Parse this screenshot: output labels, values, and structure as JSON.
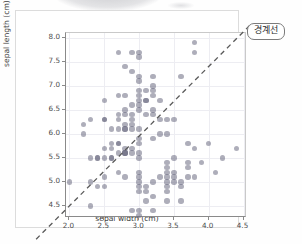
{
  "figure": {
    "annotation": {
      "label": "경계선",
      "name": "boundary-line-callout"
    },
    "watermark": {
      "visible": true
    }
  },
  "chart_data": {
    "type": "scatter",
    "title": "",
    "xlabel": "sepal width (cm)",
    "ylabel": "sepal length (cm)",
    "xlim": [
      1.95,
      4.55
    ],
    "ylim": [
      4.25,
      8.1
    ],
    "xticks": [
      "2.0",
      "2.5",
      "3.0",
      "3.5",
      "4.0",
      "4.5"
    ],
    "xtick_values": [
      2.0,
      2.5,
      3.0,
      3.5,
      4.0,
      4.5
    ],
    "yticks": [
      "4.5",
      "5.0",
      "5.5",
      "6.0",
      "6.5",
      "7.0",
      "7.5",
      "8.0"
    ],
    "ytick_values": [
      4.5,
      5.0,
      5.5,
      6.0,
      6.5,
      7.0,
      7.5,
      8.0
    ],
    "grid": true,
    "legend": "none",
    "marker": {
      "color": "#6b6b82",
      "alpha": 0.55,
      "size": 5.4,
      "shape": "circle"
    },
    "annotation_line": {
      "label": "경계선",
      "style": "dashed",
      "color": "#5a5a5a",
      "slope": 1.45,
      "intercept": 1.52,
      "x_from": 1.55,
      "x_to": 4.62
    },
    "points": [
      [
        2.0,
        5.0
      ],
      [
        2.2,
        6.2
      ],
      [
        2.2,
        6.0
      ],
      [
        2.3,
        6.3
      ],
      [
        2.3,
        5.5
      ],
      [
        2.3,
        5.0
      ],
      [
        2.3,
        4.5
      ],
      [
        2.4,
        5.5
      ],
      [
        2.4,
        5.5
      ],
      [
        2.4,
        4.9
      ],
      [
        2.5,
        6.3
      ],
      [
        2.5,
        6.7
      ],
      [
        2.5,
        6.3
      ],
      [
        2.5,
        5.7
      ],
      [
        2.5,
        5.5
      ],
      [
        2.5,
        5.1
      ],
      [
        2.5,
        4.9
      ],
      [
        2.6,
        6.1
      ],
      [
        2.6,
        5.8
      ],
      [
        2.6,
        5.7
      ],
      [
        2.6,
        5.5
      ],
      [
        2.6,
        5.5
      ],
      [
        2.7,
        7.7
      ],
      [
        2.7,
        6.8
      ],
      [
        2.7,
        6.4
      ],
      [
        2.7,
        6.3
      ],
      [
        2.7,
        6.1
      ],
      [
        2.7,
        5.8
      ],
      [
        2.7,
        5.8
      ],
      [
        2.7,
        5.6
      ],
      [
        2.7,
        5.2
      ],
      [
        2.8,
        7.4
      ],
      [
        2.8,
        6.8
      ],
      [
        2.8,
        6.5
      ],
      [
        2.8,
        6.4
      ],
      [
        2.8,
        6.2
      ],
      [
        2.8,
        6.1
      ],
      [
        2.8,
        6.1
      ],
      [
        2.8,
        5.7
      ],
      [
        2.8,
        5.6
      ],
      [
        2.8,
        5.6
      ],
      [
        2.8,
        5.6
      ],
      [
        2.8,
        5.1
      ],
      [
        2.9,
        7.7
      ],
      [
        2.9,
        7.3
      ],
      [
        2.9,
        6.6
      ],
      [
        2.9,
        6.4
      ],
      [
        2.9,
        6.3
      ],
      [
        2.9,
        6.2
      ],
      [
        2.9,
        6.1
      ],
      [
        2.9,
        5.6
      ],
      [
        2.9,
        5.7
      ],
      [
        2.9,
        4.4
      ],
      [
        3.0,
        7.7
      ],
      [
        3.0,
        7.6
      ],
      [
        3.0,
        7.2
      ],
      [
        3.0,
        7.1
      ],
      [
        3.0,
        6.9
      ],
      [
        3.0,
        6.8
      ],
      [
        3.0,
        6.7
      ],
      [
        3.0,
        6.6
      ],
      [
        3.0,
        6.5
      ],
      [
        3.0,
        6.1
      ],
      [
        3.0,
        5.9
      ],
      [
        3.0,
        5.8
      ],
      [
        3.0,
        5.6
      ],
      [
        3.0,
        5.5
      ],
      [
        3.0,
        5.2
      ],
      [
        3.0,
        5.1
      ],
      [
        3.0,
        5.0
      ],
      [
        3.0,
        4.9
      ],
      [
        3.0,
        4.8
      ],
      [
        3.0,
        4.4
      ],
      [
        3.0,
        4.3
      ],
      [
        3.1,
        6.9
      ],
      [
        3.1,
        6.7
      ],
      [
        3.1,
        6.7
      ],
      [
        3.1,
        6.4
      ],
      [
        3.1,
        4.9
      ],
      [
        3.1,
        4.8
      ],
      [
        3.1,
        4.6
      ],
      [
        3.2,
        7.2
      ],
      [
        3.2,
        7.0
      ],
      [
        3.2,
        6.9
      ],
      [
        3.2,
        6.8
      ],
      [
        3.2,
        6.5
      ],
      [
        3.2,
        6.4
      ],
      [
        3.2,
        5.9
      ],
      [
        3.2,
        5.0
      ],
      [
        3.2,
        4.7
      ],
      [
        3.2,
        4.4
      ],
      [
        3.3,
        6.7
      ],
      [
        3.3,
        6.3
      ],
      [
        3.3,
        6.0
      ],
      [
        3.3,
        5.1
      ],
      [
        3.4,
        6.3
      ],
      [
        3.4,
        6.0
      ],
      [
        3.4,
        5.4
      ],
      [
        3.4,
        5.3
      ],
      [
        3.4,
        5.2
      ],
      [
        3.4,
        5.1
      ],
      [
        3.4,
        5.0
      ],
      [
        3.4,
        4.9
      ],
      [
        3.4,
        4.8
      ],
      [
        3.4,
        4.6
      ],
      [
        3.5,
        6.3
      ],
      [
        3.5,
        5.5
      ],
      [
        3.5,
        5.2
      ],
      [
        3.5,
        5.1
      ],
      [
        3.5,
        5.0
      ],
      [
        3.6,
        7.2
      ],
      [
        3.6,
        5.0
      ],
      [
        3.6,
        4.9
      ],
      [
        3.6,
        4.6
      ],
      [
        3.7,
        5.8
      ],
      [
        3.7,
        5.4
      ],
      [
        3.7,
        5.3
      ],
      [
        3.7,
        5.1
      ],
      [
        3.8,
        7.9
      ],
      [
        3.8,
        7.7
      ],
      [
        3.8,
        5.7
      ],
      [
        3.8,
        5.1
      ],
      [
        3.9,
        5.4
      ],
      [
        4.0,
        5.8
      ],
      [
        4.1,
        5.2
      ],
      [
        4.2,
        5.5
      ],
      [
        4.4,
        5.7
      ]
    ]
  }
}
